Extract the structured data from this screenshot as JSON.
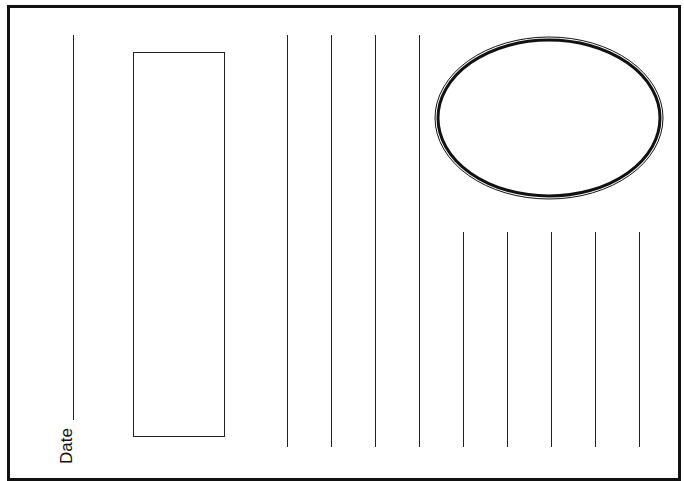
{
  "page": {
    "type": "writing-template",
    "date_label": "Date",
    "colors": {
      "line": "#222222",
      "frame": "#111111",
      "background": "#ffffff"
    }
  },
  "shapes": {
    "date_line": {
      "x": 73,
      "y1": 35,
      "y2": 420
    },
    "picture_box": {
      "x": 133,
      "y": 52,
      "width": 92,
      "height": 385
    },
    "oval": {
      "cx": 119,
      "cy": 84,
      "rx": 113,
      "ry": 80
    },
    "tall_lines_x": [
      287,
      331,
      375,
      419
    ],
    "tall_lines_y": [
      35,
      447
    ],
    "short_lines_x": [
      463,
      507,
      551,
      595,
      639
    ],
    "short_lines_y": [
      232,
      447
    ]
  }
}
